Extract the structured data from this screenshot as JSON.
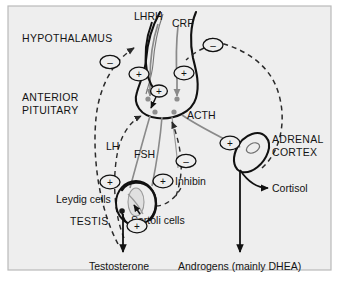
{
  "figure": {
    "panel_bg": "#eeeeee",
    "panel_border": "#b4b4b4",
    "text_color": "#141414",
    "solid_arrow_color": "#111111",
    "grey_arrow_color": "#8a8a8a",
    "dashed_arrow_color": "#2a2a2a"
  },
  "labels": {
    "hypothalamus": "HYPOTHALAMUS",
    "anterior_pituitary_line1": "ANTERIOR",
    "anterior_pituitary_line2": "PITUITARY",
    "lhrh": "LHRH",
    "crf": "CRF",
    "acth": "ACTH",
    "lh": "LH",
    "fsh": "FSH",
    "inhibin": "Inhibin",
    "adrenal_line1": "ADRENAL",
    "adrenal_line2": "CORTEX",
    "cortisol": "Cortisol",
    "leydig_cells": "Leydig cells",
    "sertoli_cells": "Sertoli cells",
    "testis": "TESTIS",
    "testosterone": "Testosterone",
    "androgens": "Androgens (mainly DHEA)"
  },
  "signs": {
    "plus": "+",
    "minus": "–",
    "nodes": [
      {
        "id": "minus-hypothalamus-left",
        "sign": "–",
        "x": 110,
        "y": 62
      },
      {
        "id": "plus-hypothalamus-left",
        "sign": "+",
        "x": 139,
        "y": 74
      },
      {
        "id": "plus-hypothalamus-right",
        "sign": "+",
        "x": 184,
        "y": 73
      },
      {
        "id": "minus-crf-feedback",
        "sign": "–",
        "x": 213,
        "y": 45
      },
      {
        "id": "plus-pituitary-center",
        "sign": "+",
        "x": 159,
        "y": 91
      },
      {
        "id": "plus-adrenal-acth",
        "sign": "+",
        "x": 230,
        "y": 143
      },
      {
        "id": "minus-inhibin-feedback",
        "sign": "–",
        "x": 186,
        "y": 161
      },
      {
        "id": "plus-lh-leydig",
        "sign": "+",
        "x": 110,
        "y": 182
      },
      {
        "id": "plus-fsh-sertoli",
        "sign": "+",
        "x": 163,
        "y": 181
      },
      {
        "id": "plus-testosterone-sertoli",
        "sign": "+",
        "x": 137,
        "y": 226
      }
    ]
  },
  "axes": {
    "gonadal": {
      "releasing_hormone": "LHRH",
      "pituitary_hormones": [
        "LH",
        "FSH"
      ],
      "target_organ": "TESTIS",
      "target_cells": [
        "Leydig cells",
        "Sertoli cells"
      ],
      "products": [
        "Testosterone",
        "Inhibin"
      ]
    },
    "adrenal": {
      "releasing_hormone": "CRF",
      "pituitary_hormone": "ACTH",
      "target_organ": "ADRENAL CORTEX",
      "products": [
        "Cortisol",
        "Androgens (mainly DHEA)"
      ]
    }
  }
}
